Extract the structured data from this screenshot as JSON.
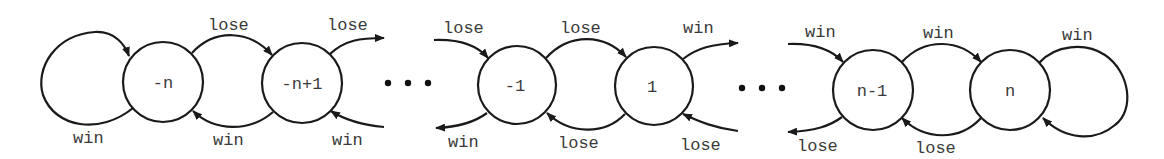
{
  "diagram": {
    "colors": {
      "stroke": "#1a1a1a",
      "text": "#3a3a3a",
      "background": "#ffffff"
    },
    "nodes": [
      {
        "id": "neg-n",
        "label": "-n",
        "cx": 163,
        "cy": 82,
        "r": 40
      },
      {
        "id": "neg-n+1",
        "label": "-n+1",
        "cx": 302,
        "cy": 83,
        "r": 40
      },
      {
        "id": "neg-1",
        "label": "-1",
        "cx": 517,
        "cy": 85,
        "r": 39
      },
      {
        "id": "pos-1",
        "label": "1",
        "cx": 654,
        "cy": 86,
        "r": 39
      },
      {
        "id": "n-1",
        "label": "n-1",
        "cx": 873,
        "cy": 90,
        "r": 40
      },
      {
        "id": "n",
        "label": "n",
        "cx": 1010,
        "cy": 90,
        "r": 40
      }
    ],
    "ellipses": [
      {
        "id": "ellipsis-left",
        "dots": [
          388,
          408,
          428
        ],
        "y": 83
      },
      {
        "id": "ellipsis-right",
        "dots": [
          742,
          762,
          782
        ],
        "y": 88
      }
    ],
    "edge_labels": [
      {
        "id": "self-loop-neg-n",
        "text": "win",
        "x": 73,
        "y": 143
      },
      {
        "id": "neg-n-to-neg-n+1",
        "text": "lose",
        "x": 208,
        "y": 30
      },
      {
        "id": "neg-n+1-to-neg-n",
        "text": "win",
        "x": 213,
        "y": 145
      },
      {
        "id": "neg-n+1-out-top",
        "text": "lose",
        "x": 327,
        "y": 30
      },
      {
        "id": "neg-n+1-in-bottom",
        "text": "win",
        "x": 332,
        "y": 145
      },
      {
        "id": "neg-1-in-top",
        "text": "lose",
        "x": 443,
        "y": 33
      },
      {
        "id": "neg-1-out-bottom",
        "text": "win",
        "x": 448,
        "y": 147
      },
      {
        "id": "neg-1-to-1",
        "text": "lose",
        "x": 560,
        "y": 33
      },
      {
        "id": "1-to-neg-1",
        "text": "lose",
        "x": 558,
        "y": 148
      },
      {
        "id": "1-out-top",
        "text": "win",
        "x": 683,
        "y": 33
      },
      {
        "id": "1-in-bottom",
        "text": "lose",
        "x": 680,
        "y": 150
      },
      {
        "id": "n-1-in-top",
        "text": "win",
        "x": 805,
        "y": 37
      },
      {
        "id": "n-1-out-bottom",
        "text": "lose",
        "x": 797,
        "y": 151
      },
      {
        "id": "n-1-to-n",
        "text": "win",
        "x": 923,
        "y": 38
      },
      {
        "id": "n-to-n-1",
        "text": "lose",
        "x": 915,
        "y": 153
      },
      {
        "id": "self-loop-n",
        "text": "win",
        "x": 1062,
        "y": 40
      }
    ]
  }
}
